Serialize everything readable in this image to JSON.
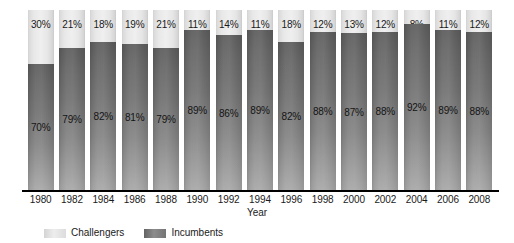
{
  "chart_data": {
    "type": "bar",
    "subtype": "stacked-100-percent",
    "title": "",
    "xlabel": "Year",
    "ylabel": "",
    "ylim": [
      0,
      100
    ],
    "grid": false,
    "legend_position": "bottom-left",
    "categories": [
      "1980",
      "1982",
      "1984",
      "1986",
      "1988",
      "1990",
      "1992",
      "1994",
      "1996",
      "1998",
      "2000",
      "2002",
      "2004",
      "2006",
      "2008"
    ],
    "series": [
      {
        "name": "Challengers",
        "color": "#e8e8e8",
        "values": [
          30,
          21,
          18,
          19,
          21,
          11,
          14,
          11,
          18,
          12,
          13,
          12,
          8,
          11,
          12
        ],
        "labels": [
          "30%",
          "21%",
          "18%",
          "19%",
          "21%",
          "11%",
          "14%",
          "11%",
          "18%",
          "12%",
          "13%",
          "12%",
          "8%",
          "11%",
          "12%"
        ]
      },
      {
        "name": "Incumbents",
        "color": "#7a7a7a",
        "values": [
          70,
          79,
          82,
          81,
          79,
          89,
          86,
          89,
          82,
          88,
          87,
          88,
          92,
          89,
          88
        ],
        "labels": [
          "70%",
          "79%",
          "82%",
          "81%",
          "79%",
          "89%",
          "86%",
          "89%",
          "82%",
          "88%",
          "87%",
          "88%",
          "92%",
          "89%",
          "88%"
        ]
      }
    ]
  },
  "axis": {
    "title": "Year"
  },
  "legend": {
    "items": [
      {
        "label": "Challengers",
        "swatch": "challengers"
      },
      {
        "label": "Incumbents",
        "swatch": "incumbents"
      }
    ]
  }
}
